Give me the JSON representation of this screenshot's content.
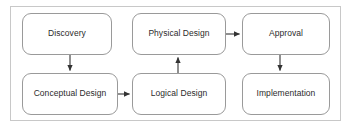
{
  "diagram": {
    "frame": {
      "border_color": "#c8c8c8",
      "background_color": "#ffffff"
    },
    "style": {
      "node_fill": "#ffffff",
      "node_border": "#9a9a9a",
      "text_color": "#2b2b2b",
      "arrow_color": "#333333"
    },
    "nodes": [
      {
        "id": "discovery",
        "label": "Discovery",
        "row": "top",
        "column": 1
      },
      {
        "id": "physical_design",
        "label": "Physical Design",
        "row": "top",
        "column": 2
      },
      {
        "id": "approval",
        "label": "Approval",
        "row": "top",
        "column": 3
      },
      {
        "id": "conceptual_design",
        "label": "Conceptual Design",
        "row": "bottom",
        "column": 1
      },
      {
        "id": "logical_design",
        "label": "Logical Design",
        "row": "bottom",
        "column": 2
      },
      {
        "id": "implementation",
        "label": "Implementation",
        "row": "bottom",
        "column": 3
      }
    ],
    "edges": [
      {
        "id": "e1",
        "from": "discovery",
        "to": "conceptual_design",
        "direction": "down"
      },
      {
        "id": "e2",
        "from": "conceptual_design",
        "to": "logical_design",
        "direction": "right"
      },
      {
        "id": "e3",
        "from": "logical_design",
        "to": "physical_design",
        "direction": "up"
      },
      {
        "id": "e4",
        "from": "physical_design",
        "to": "approval",
        "direction": "right"
      },
      {
        "id": "e5",
        "from": "approval",
        "to": "implementation",
        "direction": "down"
      }
    ]
  }
}
